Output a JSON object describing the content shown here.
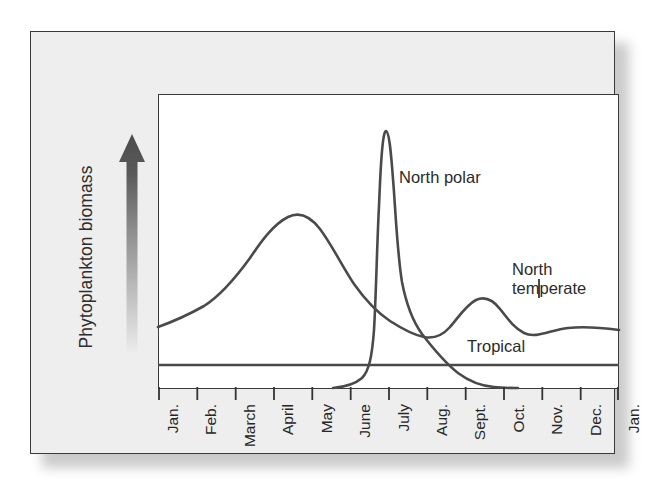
{
  "figure": {
    "background_color": "#eeeeee",
    "plot_background_color": "#ffffff",
    "frame_color": "#3a3a3a",
    "curve_color": "#4a4a4a",
    "y_axis": {
      "label": "Phytoplankton biomass",
      "arrow_icon": "up-arrow-gradient-icon"
    }
  },
  "chart_data": {
    "type": "line",
    "title": "",
    "xlabel": "",
    "ylabel": "Phytoplankton biomass",
    "grid": false,
    "legend": "inline-annotations",
    "categories": [
      "Jan.",
      "Feb.",
      "March",
      "April",
      "May",
      "June",
      "July",
      "Aug.",
      "Sept.",
      "Oct.",
      "Nov.",
      "Dec.",
      "Jan."
    ],
    "ylim": [
      0,
      100
    ],
    "y_ticks": [],
    "annotations": [
      {
        "text": "North polar",
        "series": "North polar"
      },
      {
        "text": "North temperate",
        "series": "North temperate"
      },
      {
        "text": "Tropical",
        "series": "Tropical"
      }
    ],
    "series": [
      {
        "name": "North temperate",
        "label_line1": "North",
        "label_line2": "temperate",
        "values": [
          21,
          27,
          45,
          58,
          50,
          38,
          30,
          25,
          22,
          28,
          24,
          21,
          20
        ]
      },
      {
        "name": "North polar",
        "label_line1": "North polar",
        "label_line2": "",
        "values": [
          1,
          1,
          1,
          1,
          2,
          10,
          92,
          40,
          12,
          2,
          1,
          1,
          1
        ]
      },
      {
        "name": "Tropical",
        "label_line1": "Tropical",
        "label_line2": "",
        "values": [
          10,
          10,
          10,
          10,
          10,
          10,
          10,
          10,
          10,
          10,
          10,
          10,
          10
        ]
      }
    ]
  }
}
